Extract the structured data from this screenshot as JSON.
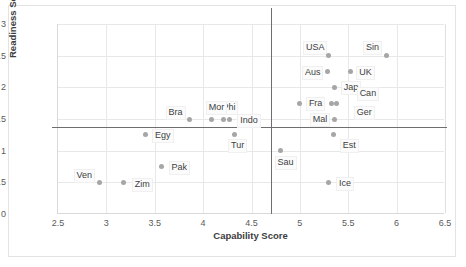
{
  "chart_data": {
    "type": "scatter",
    "title": "",
    "xlabel": "Capability Score",
    "ylabel": "Readiness Score",
    "xlim": [
      2.5,
      6.5
    ],
    "ylim": [
      0,
      3
    ],
    "xticks": [
      "2.5",
      "3",
      "3.5",
      "4",
      "4.5",
      "5",
      "5.5",
      "6",
      "6.5"
    ],
    "yticks": [
      "0",
      "0.5",
      "1",
      "1.5",
      "2",
      "2.5",
      "3"
    ],
    "grid": true,
    "legend": "none",
    "point_color": "#a6a6a6",
    "reference_lines": [
      {
        "orientation": "horizontal",
        "value": 1.37,
        "color": "#6e6e6e"
      },
      {
        "orientation": "vertical",
        "value": 4.7,
        "color": "#6e6e6e"
      }
    ],
    "points": [
      {
        "label": "USA",
        "x": 5.3,
        "y": 2.5,
        "lx": -26,
        "ly": -15
      },
      {
        "label": "Sin",
        "x": 5.9,
        "y": 2.5,
        "lx": -24,
        "ly": -15
      },
      {
        "label": "Aus",
        "x": 5.29,
        "y": 2.25,
        "lx": -26,
        "ly": -6
      },
      {
        "label": "UK",
        "x": 5.52,
        "y": 2.25,
        "lx": 6,
        "ly": -6
      },
      {
        "label": "Jap",
        "x": 5.36,
        "y": 2.0,
        "lx": 6,
        "ly": -6
      },
      {
        "label": "Can",
        "x": 5.38,
        "y": 1.75,
        "lx": 20,
        "ly": -16
      },
      {
        "label": "Fra",
        "x": 5.0,
        "y": 1.75,
        "lx": 6,
        "ly": -6
      },
      {
        "label": "Ger",
        "x": 5.33,
        "y": 1.75,
        "lx": 22,
        "ly": 3
      },
      {
        "label": "Mal",
        "x": 5.36,
        "y": 1.5,
        "lx": -25,
        "ly": -6
      },
      {
        "label": "Phi",
        "x": 4.21,
        "y": 1.5,
        "lx": -4,
        "ly": -18
      },
      {
        "label": "Indo",
        "x": 4.27,
        "y": 1.5,
        "lx": 8,
        "ly": -5
      },
      {
        "label": "Mor",
        "x": 4.09,
        "y": 1.5,
        "lx": -6,
        "ly": -18
      },
      {
        "label": "Bra",
        "x": 3.86,
        "y": 1.5,
        "lx": -24,
        "ly": -13
      },
      {
        "label": "Est",
        "x": 5.35,
        "y": 1.25,
        "lx": 6,
        "ly": 4
      },
      {
        "label": "Egy",
        "x": 3.4,
        "y": 1.25,
        "lx": 7,
        "ly": -6
      },
      {
        "label": "Tur",
        "x": 4.32,
        "y": 1.25,
        "lx": -6,
        "ly": 4
      },
      {
        "label": "Sau",
        "x": 4.8,
        "y": 1.0,
        "lx": -6,
        "ly": 5
      },
      {
        "label": "Pak",
        "x": 3.57,
        "y": 0.75,
        "lx": 7,
        "ly": -6
      },
      {
        "label": "Ven",
        "x": 2.93,
        "y": 0.5,
        "lx": -26,
        "ly": -13
      },
      {
        "label": "Zim",
        "x": 3.18,
        "y": 0.5,
        "lx": 8,
        "ly": -4
      },
      {
        "label": "Ice",
        "x": 5.3,
        "y": 0.5,
        "lx": 7,
        "ly": -5
      }
    ]
  }
}
